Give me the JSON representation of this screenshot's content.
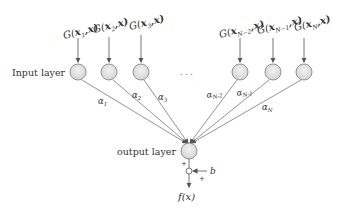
{
  "diagram": {
    "input_layer_label": "Input layer",
    "output_layer_label": "output layer",
    "ellipsis": ". . .",
    "inputs": [
      {
        "func": "G(",
        "x": "x",
        "sub": "1",
        "tail": ",x)",
        "alpha": "α",
        "alpha_sub": "1"
      },
      {
        "func": "G(",
        "x": "x",
        "sub": "2",
        "tail": ",x)",
        "alpha": "α",
        "alpha_sub": "2"
      },
      {
        "func": "G(",
        "x": "x",
        "sub": "3",
        "tail": ",x)",
        "alpha": "α",
        "alpha_sub": "3"
      },
      {
        "func": "G(",
        "x": "x",
        "sub": "N−2",
        "tail": ",x)",
        "alpha": "α",
        "alpha_sub": "N-2"
      },
      {
        "func": "G(",
        "x": "x",
        "sub": "N−1",
        "tail": ",x)",
        "alpha": "α",
        "alpha_sub": "N-1"
      },
      {
        "func": "G(",
        "x": "x",
        "sub": "N",
        "tail": ",x)",
        "alpha": "α",
        "alpha_sub": "N"
      }
    ],
    "bias_label": "b",
    "plus_top": "+",
    "plus_bias": "+",
    "output_label": "f(x)",
    "colors": {
      "node_fill": "#e6e6e6",
      "node_stroke": "#888888",
      "line": "#666666",
      "text": "#333333"
    }
  }
}
